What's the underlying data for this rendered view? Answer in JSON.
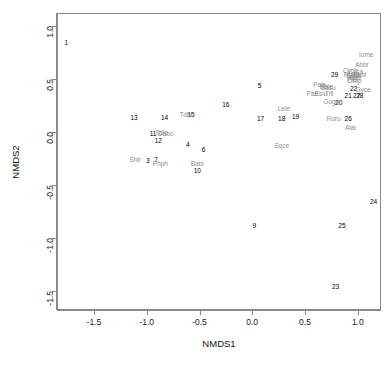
{
  "chart_data": {
    "type": "scatter",
    "title": "",
    "xlabel": "NMDS1",
    "ylabel": "NMDS2",
    "xlim": [
      -1.85,
      1.22
    ],
    "ylim": [
      -1.68,
      1.12
    ],
    "xticks": [
      "-1.5",
      "-1.0",
      "-0.5",
      "0.0",
      "0.5",
      "1.0"
    ],
    "xtick_values": [
      -1.5,
      -1.0,
      -0.5,
      0.0,
      0.5,
      1.0
    ],
    "yticks": [
      "1.0",
      "0.5",
      "0.0",
      "-0.5",
      "-1.0",
      "-1.5"
    ],
    "ytick_values": [
      1.0,
      0.5,
      0.0,
      -0.5,
      -1.0,
      -1.5
    ],
    "grid": false,
    "legend": "none",
    "series": [
      {
        "name": "sites",
        "color": "#000000",
        "label_kind": "site",
        "points": [
          {
            "label": "1",
            "x": -1.77,
            "y": 0.85
          },
          {
            "label": "29",
            "x": 0.77,
            "y": 0.55
          },
          {
            "label": "5",
            "x": 0.06,
            "y": 0.44
          },
          {
            "label": "22",
            "x": 0.95,
            "y": 0.41
          },
          {
            "label": "21",
            "x": 0.9,
            "y": 0.35
          },
          {
            "label": "27",
            "x": 0.98,
            "y": 0.35
          },
          {
            "label": "28",
            "x": 1.01,
            "y": 0.35
          },
          {
            "label": "20",
            "x": 0.81,
            "y": 0.28
          },
          {
            "label": "16",
            "x": -0.26,
            "y": 0.26
          },
          {
            "label": "13",
            "x": -1.13,
            "y": 0.14
          },
          {
            "label": "14",
            "x": -0.84,
            "y": 0.14
          },
          {
            "label": "15",
            "x": -0.59,
            "y": 0.17
          },
          {
            "label": "17",
            "x": 0.07,
            "y": 0.13
          },
          {
            "label": "18",
            "x": 0.27,
            "y": 0.13
          },
          {
            "label": "19",
            "x": 0.4,
            "y": 0.15
          },
          {
            "label": "26",
            "x": 0.9,
            "y": 0.13
          },
          {
            "label": "11",
            "x": -0.95,
            "y": -0.01
          },
          {
            "label": "12",
            "x": -0.9,
            "y": -0.08
          },
          {
            "label": "4",
            "x": -0.62,
            "y": -0.11
          },
          {
            "label": "6",
            "x": -0.47,
            "y": -0.16
          },
          {
            "label": "3",
            "x": -1.0,
            "y": -0.27
          },
          {
            "label": "7",
            "x": -0.92,
            "y": -0.26
          },
          {
            "label": "10",
            "x": -0.53,
            "y": -0.36
          },
          {
            "label": "24",
            "x": 1.14,
            "y": -0.65
          },
          {
            "label": "9",
            "x": 0.01,
            "y": -0.88
          },
          {
            "label": "25",
            "x": 0.84,
            "y": -0.88
          },
          {
            "label": "23",
            "x": 0.78,
            "y": -1.45
          }
        ]
      },
      {
        "name": "species",
        "color": "#8c8c8c",
        "label_kind": "species",
        "points": [
          {
            "label": "Iome",
            "x": 1.07,
            "y": 0.73
          },
          {
            "label": "Abbr",
            "x": 1.03,
            "y": 0.64
          },
          {
            "label": "Cych",
            "x": 0.92,
            "y": 0.585
          },
          {
            "label": "Cyca",
            "x": 0.97,
            "y": 0.575
          },
          {
            "label": "Nomi",
            "x": 0.93,
            "y": 0.545
          },
          {
            "label": "Sasa",
            "x": 0.95,
            "y": 0.535
          },
          {
            "label": "Sbbl",
            "x": 1.01,
            "y": 0.545
          },
          {
            "label": "Tofo",
            "x": 0.96,
            "y": 0.515
          },
          {
            "label": "Plel",
            "x": 0.94,
            "y": 0.495
          },
          {
            "label": "Dtop",
            "x": 0.96,
            "y": 0.485
          },
          {
            "label": "Pale",
            "x": 0.63,
            "y": 0.455
          },
          {
            "label": "Bate",
            "x": 0.69,
            "y": 0.435
          },
          {
            "label": "Sasu",
            "x": 0.71,
            "y": 0.425
          },
          {
            "label": "Gyce",
            "x": 1.04,
            "y": 0.405
          },
          {
            "label": "Pati",
            "x": 0.56,
            "y": 0.365
          },
          {
            "label": "Eslu",
            "x": 0.64,
            "y": 0.365
          },
          {
            "label": "Tifl",
            "x": 0.72,
            "y": 0.365
          },
          {
            "label": "Gogo",
            "x": 0.74,
            "y": 0.295
          },
          {
            "label": "Lele",
            "x": 0.29,
            "y": 0.225
          },
          {
            "label": "Ruru",
            "x": 0.76,
            "y": 0.135
          },
          {
            "label": "Alal",
            "x": 0.92,
            "y": 0.045
          },
          {
            "label": "Tdlo",
            "x": -0.87,
            "y": -0.005
          },
          {
            "label": "Dabo",
            "x": -0.83,
            "y": -0.015
          },
          {
            "label": "Tdbb",
            "x": -0.63,
            "y": 0.165
          },
          {
            "label": "Sqce",
            "x": 0.27,
            "y": -0.125
          },
          {
            "label": "Shir",
            "x": -1.12,
            "y": -0.255
          },
          {
            "label": "Phph",
            "x": -0.88,
            "y": -0.295
          },
          {
            "label": "Babi",
            "x": -0.53,
            "y": -0.295
          }
        ]
      }
    ]
  },
  "axes": {
    "x_title": "NMDS1",
    "y_title": "NMDS2"
  }
}
